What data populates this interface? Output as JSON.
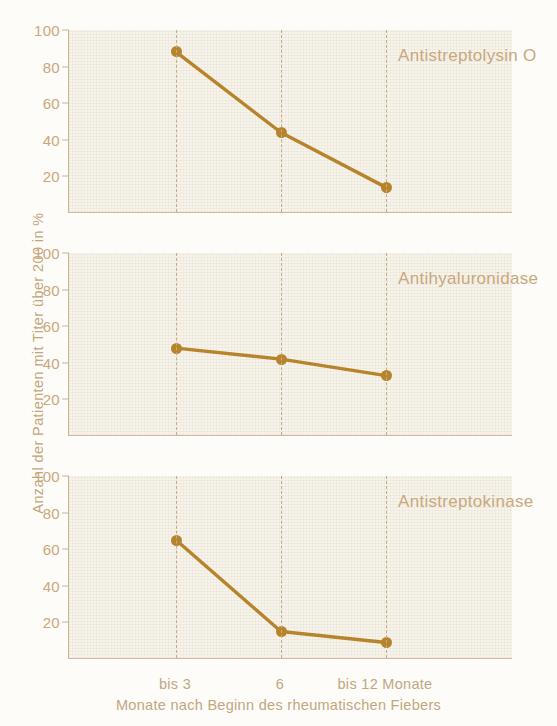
{
  "chart_data": {
    "type": "line",
    "title": "",
    "xlabel": "Monate nach Beginn des rheumatischen Fiebers",
    "ylabel": "Anzahl der Patienten mit Titer über 200 in %",
    "categories": [
      "bis 3",
      "6",
      "bis 12 Monate"
    ],
    "x": [
      1,
      2,
      3
    ],
    "ylim": [
      0,
      100
    ],
    "yticks": [
      20,
      40,
      60,
      80,
      100
    ],
    "grid": "dashed vertical lines at each category",
    "legend": "none (series name annotated inside each panel, top-right)",
    "panels": [
      {
        "name": "Antistreptolysin O",
        "values": [
          88,
          44,
          14
        ]
      },
      {
        "name": "Antihyaluronidase",
        "values": [
          48,
          42,
          33
        ]
      },
      {
        "name": "Antistreptokinase",
        "values": [
          65,
          15,
          9
        ]
      }
    ],
    "series": [
      {
        "name": "Antistreptolysin O",
        "values": [
          88,
          44,
          14
        ]
      },
      {
        "name": "Antihyaluronidase",
        "values": [
          48,
          42,
          33
        ]
      },
      {
        "name": "Antistreptokinase",
        "values": [
          65,
          15,
          9
        ]
      }
    ],
    "colors": {
      "line": "#b7832b",
      "marker": "#b7832b",
      "plot_background": "#f7f4ec",
      "page_background": "#fdfcf8",
      "axis": "#cbb491",
      "tick_text": "#c9a87c",
      "gridline": "#c3ab8c"
    }
  },
  "axes": {
    "y": {
      "label": "Anzahl der Patienten mit Titer über 200 in %",
      "ticks": [
        "20",
        "40",
        "60",
        "80",
        "100"
      ]
    },
    "x": {
      "label": "Monate nach Beginn des rheumatischen Fiebers",
      "ticks": [
        "bis 3",
        "6",
        "bis 12 Monate"
      ]
    }
  },
  "panels": [
    {
      "caption": "Antistreptolysin O"
    },
    {
      "caption": "Antihyaluronidase"
    },
    {
      "caption": "Antistreptokinase"
    }
  ]
}
